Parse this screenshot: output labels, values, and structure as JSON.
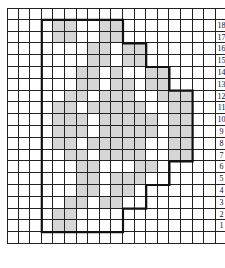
{
  "figure": {
    "type": "stitch-chart",
    "grid": {
      "cols": 19,
      "rows": 20,
      "cell_w": 11.6,
      "cell_h": 11.8,
      "origin_x": 7,
      "origin_y": 8
    },
    "outline_origin_col": 3,
    "row_labels": [
      "18",
      "17",
      "16",
      "15",
      "14",
      "13",
      "12",
      "11",
      "10",
      "9",
      "8",
      "7",
      "6",
      "5",
      "4",
      "3",
      "2",
      "1"
    ],
    "shade_color": "#d6d6d6",
    "line_color": "#222222",
    "outline_right_extent": {
      "18": 6,
      "17": 6,
      "16": 8,
      "15": 8,
      "14": 10,
      "13": 10,
      "12": 12,
      "11": 12,
      "10": 12,
      "9": 12,
      "8": 12,
      "7": 12,
      "6": 10,
      "5": 10,
      "4": 8,
      "3": 8,
      "2": 6,
      "1": 6
    },
    "shaded": {
      "18": [
        1,
        2,
        5,
        6
      ],
      "17": [
        1,
        2,
        5,
        6
      ],
      "16": [
        4,
        5,
        7,
        8
      ],
      "15": [
        4,
        5,
        7,
        8
      ],
      "14": [
        3,
        4,
        6,
        9,
        10
      ],
      "13": [
        3,
        4,
        6,
        7,
        9,
        10
      ],
      "12": [
        2,
        3,
        5,
        6,
        7,
        10,
        11,
        12
      ],
      "11": [
        1,
        2,
        4,
        5,
        6,
        7,
        8,
        11,
        12
      ],
      "10": [
        1,
        2,
        3,
        5,
        6,
        7,
        8,
        9,
        11,
        12
      ],
      "9": [
        1,
        2,
        3,
        5,
        6,
        7,
        8,
        9,
        11,
        12
      ],
      "8": [
        1,
        2,
        4,
        5,
        6,
        7,
        8,
        11,
        12
      ],
      "7": [
        2,
        3,
        5,
        6,
        7,
        8,
        11,
        12
      ],
      "6": [
        3,
        4,
        8,
        9
      ],
      "5": [
        3,
        4,
        6,
        7,
        8
      ],
      "4": [
        3,
        4,
        6,
        7
      ],
      "3": [
        2,
        3,
        5,
        6
      ],
      "2": [
        1,
        2
      ],
      "1": [
        1,
        2
      ]
    }
  }
}
